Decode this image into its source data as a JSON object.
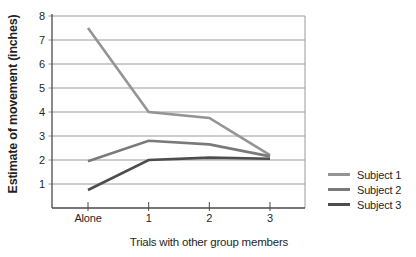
{
  "chart_data": {
    "type": "line",
    "categories": [
      "Alone",
      "1",
      "2",
      "3"
    ],
    "series": [
      {
        "name": "Subject 1",
        "values": [
          7.5,
          4.0,
          3.75,
          2.2
        ],
        "color": "#949494"
      },
      {
        "name": "Subject 2",
        "values": [
          1.95,
          2.8,
          2.65,
          2.15
        ],
        "color": "#7a7a7a"
      },
      {
        "name": "Subject 3",
        "values": [
          0.75,
          2.0,
          2.1,
          2.05
        ],
        "color": "#4d4d4d"
      }
    ],
    "title": "",
    "xlabel": "Trials with other group members",
    "ylabel": "Estimate of movement (inches)",
    "ylim": [
      0,
      8
    ],
    "yticks": [
      1,
      2,
      3,
      4,
      5,
      6,
      7,
      8
    ],
    "grid": "horizontal",
    "legend_position": "right"
  },
  "colors": {
    "background": "#ffffff",
    "gridline": "#8f8f8f",
    "axis": "#4a4a4a",
    "text": "#1f1f1f"
  }
}
